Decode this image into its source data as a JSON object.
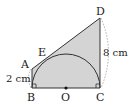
{
  "diagram": {
    "type": "geometry",
    "points": {
      "A": {
        "label": "A",
        "x": 32,
        "y": 69
      },
      "B": {
        "label": "B",
        "x": 32,
        "y": 88
      },
      "C": {
        "label": "C",
        "x": 100,
        "y": 88
      },
      "D": {
        "label": "D",
        "x": 100,
        "y": 18
      },
      "E": {
        "label": "E",
        "x": 50,
        "y": 56
      },
      "O": {
        "label": "O",
        "x": 66,
        "y": 88
      }
    },
    "measurements": {
      "AB": "2 cm",
      "CD": "8 cm"
    },
    "colors": {
      "fill": "#d4d4d4",
      "stroke": "#333333",
      "dashed": "#888888"
    }
  }
}
